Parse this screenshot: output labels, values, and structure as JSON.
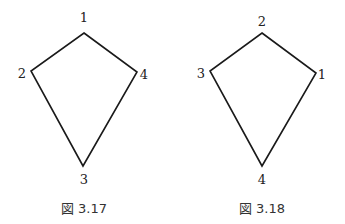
{
  "figures": [
    {
      "caption": "図 3.17",
      "vertices": [
        {
          "label": "1",
          "x": 84,
          "y": 33,
          "lx": 84,
          "ly": 22
        },
        {
          "label": "2",
          "x": 31,
          "y": 71,
          "lx": 22,
          "ly": 78
        },
        {
          "label": "3",
          "x": 83,
          "y": 166,
          "lx": 84,
          "ly": 184
        },
        {
          "label": "4",
          "x": 137,
          "y": 72,
          "lx": 144,
          "ly": 79
        }
      ],
      "polygon_order": [
        "1",
        "4",
        "3",
        "2"
      ]
    },
    {
      "caption": "図 3.18",
      "vertices": [
        {
          "label": "2",
          "x": 262,
          "y": 33,
          "lx": 262,
          "ly": 26
        },
        {
          "label": "3",
          "x": 210,
          "y": 71,
          "lx": 201,
          "ly": 78
        },
        {
          "label": "1",
          "x": 316,
          "y": 73,
          "lx": 322,
          "ly": 79
        },
        {
          "label": "4",
          "x": 262,
          "y": 166,
          "lx": 262,
          "ly": 184
        }
      ],
      "polygon_order": [
        "2",
        "1",
        "4",
        "3"
      ]
    }
  ],
  "colors": {
    "stroke": "#1a1a1a",
    "text": "#222222",
    "background": "#ffffff"
  }
}
